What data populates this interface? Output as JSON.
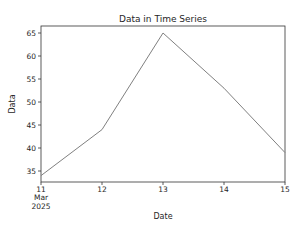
{
  "chart_data": {
    "type": "line",
    "title": "Data in Time Series",
    "xlabel": "Date",
    "ylabel": "Data",
    "categories": [
      "11",
      "12",
      "13",
      "14",
      "15"
    ],
    "x_tick_sublabels": [
      "Mar",
      "2025"
    ],
    "series": [
      {
        "name": "Data",
        "values": [
          34,
          44,
          65,
          53,
          39
        ],
        "color": "#808080"
      }
    ],
    "yticks": [
      35,
      40,
      45,
      50,
      55,
      60,
      65
    ],
    "ylim": [
      32.5,
      66.5
    ],
    "grid": false,
    "legend": null
  }
}
